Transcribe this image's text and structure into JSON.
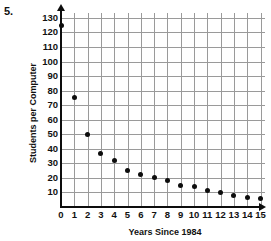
{
  "problem": {
    "number": "5."
  },
  "chart_data": {
    "type": "scatter",
    "title": "",
    "xlabel": "Years Since 1984",
    "ylabel": "Students per Computer",
    "xlim": [
      0,
      15.5
    ],
    "ylim": [
      0,
      135
    ],
    "grid": true,
    "legend": "none",
    "x": [
      0,
      1,
      2,
      3,
      4,
      5,
      6,
      7,
      8,
      9,
      10,
      11,
      12,
      13,
      14,
      15
    ],
    "values": [
      125,
      75,
      50,
      37,
      32,
      25,
      22,
      20,
      18,
      15,
      14,
      11,
      10,
      8,
      6.5,
      6
    ],
    "xticks": [
      "0",
      "1",
      "2",
      "3",
      "4",
      "5",
      "6",
      "7",
      "8",
      "9",
      "10",
      "11",
      "12",
      "13",
      "14",
      "15"
    ],
    "yticks": [
      "10",
      "20",
      "30",
      "40",
      "50",
      "60",
      "70",
      "80",
      "90",
      "100",
      "110",
      "120",
      "130"
    ],
    "ytick_values": [
      10,
      20,
      30,
      40,
      50,
      60,
      70,
      80,
      90,
      100,
      110,
      120,
      130
    ],
    "point_color": "#0d0d0d",
    "grid_color": "#9a9a9a",
    "axis_color": "#0d0d0d"
  }
}
